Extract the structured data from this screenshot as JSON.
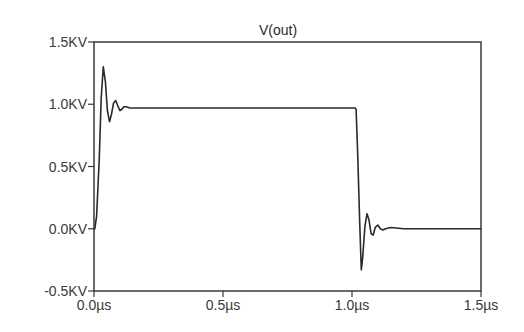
{
  "chart_data": {
    "type": "line",
    "title": "V(out)",
    "xlabel": "",
    "ylabel": "",
    "x_unit": "µs",
    "y_unit": "KV",
    "xlim": [
      0.0,
      1.5
    ],
    "ylim": [
      -0.5,
      1.5
    ],
    "grid": false,
    "legend": "none",
    "x_ticks": [
      0.0,
      0.5,
      1.0,
      1.5
    ],
    "x_tick_labels": [
      "0.0µs",
      "0.5µs",
      "1.0µs",
      "1.5µs"
    ],
    "y_ticks": [
      -0.5,
      0.0,
      0.5,
      1.0,
      1.5
    ],
    "y_tick_labels": [
      "-0.5KV",
      "0.0KV",
      "0.5KV",
      "1.0KV",
      "1.5KV"
    ],
    "series": [
      {
        "name": "V(out)",
        "color": "#2a2a2a",
        "x": [
          0.0,
          0.003,
          0.01,
          0.02,
          0.028,
          0.036,
          0.044,
          0.052,
          0.06,
          0.068,
          0.076,
          0.084,
          0.092,
          0.1,
          0.108,
          0.116,
          0.124,
          0.14,
          0.16,
          0.2,
          0.3,
          0.5,
          0.8,
          1.0,
          1.012,
          1.016,
          1.022,
          1.03,
          1.036,
          1.042,
          1.05,
          1.058,
          1.066,
          1.074,
          1.082,
          1.09,
          1.1,
          1.11,
          1.12,
          1.13,
          1.15,
          1.2,
          1.3,
          1.4,
          1.5
        ],
        "values": [
          0.0,
          0.0,
          0.1,
          0.55,
          1.05,
          1.3,
          1.18,
          0.95,
          0.86,
          0.92,
          1.01,
          1.03,
          0.99,
          0.95,
          0.96,
          0.98,
          0.98,
          0.97,
          0.97,
          0.97,
          0.97,
          0.97,
          0.97,
          0.97,
          0.97,
          0.96,
          0.6,
          0.05,
          -0.33,
          -0.22,
          0.02,
          0.12,
          0.07,
          -0.04,
          -0.05,
          0.01,
          0.03,
          0.0,
          -0.01,
          0.0,
          0.01,
          0.0,
          0.0,
          0.0,
          0.0
        ]
      }
    ]
  },
  "plot": {
    "left": 94,
    "right": 481,
    "top": 42,
    "bottom": 291
  }
}
